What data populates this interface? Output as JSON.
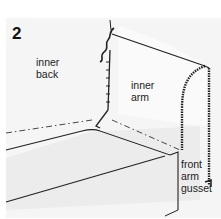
{
  "figure": {
    "step_number": "2",
    "labels": {
      "inner_back": [
        "inner",
        "back"
      ],
      "inner_arm": [
        "inner",
        "arm"
      ],
      "front_arm_gusset": [
        "front",
        "arm",
        "gusset"
      ]
    },
    "colors": {
      "background": "#f5f5f5",
      "line": "#222222",
      "seat_fill": "#ececec"
    }
  }
}
